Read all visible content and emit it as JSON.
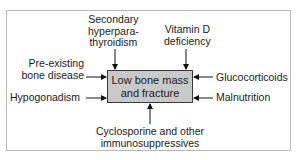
{
  "diagram": {
    "center": "Low bone mass\nand fracture",
    "causes": {
      "top_left": "Secondary\nhyperpara-\nthyroidism",
      "top_right": "Vitamin D\ndeficiency",
      "left_upper": "Pre-existing\nbone disease",
      "left_lower": "Hypogonadism",
      "right_upper": "Glucocorticoids",
      "right_lower": "Malnutrition",
      "bottom": "Cyclosporine and other\nimmunosuppressives"
    }
  }
}
